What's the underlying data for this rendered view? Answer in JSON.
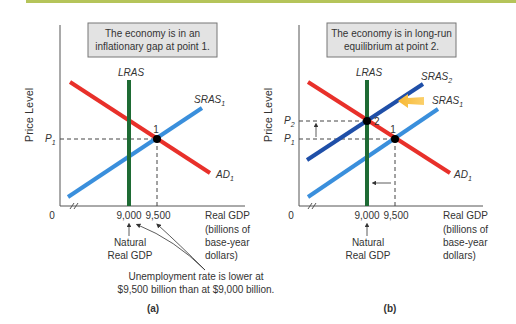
{
  "colors": {
    "top_rule": "#b5c45a",
    "ad": "#e8302a",
    "sras1": "#3a8fdc",
    "sras2": "#1f4fa8",
    "lras": "#1e6b34",
    "box_fill": "#e3e3e3",
    "box_stroke": "#777777",
    "shift_arrow": "#f5a623"
  },
  "panels": [
    {
      "id": "a",
      "caption": "(a)",
      "box_text": [
        "The economy is in an",
        "inflationary gap at point 1."
      ],
      "y_axis_label": "Price Level",
      "x_axis_label": [
        "Real GDP",
        "(billions of",
        "base-year",
        "dollars)"
      ],
      "origin": "0",
      "x_ticks": [
        "9,000",
        "9,500"
      ],
      "y_ticks": [
        {
          "main": "P",
          "sub": "1"
        }
      ],
      "curves": {
        "lras": "LRAS",
        "sras1": {
          "main": "SRAS",
          "sub": "1"
        },
        "ad1": {
          "main": "AD",
          "sub": "1"
        }
      },
      "points": [
        "1"
      ],
      "natural_label": [
        "Natural",
        "Real GDP"
      ],
      "annotation": [
        "Unemployment rate is lower at",
        "$9,500 billion than at $9,000 billion."
      ]
    },
    {
      "id": "b",
      "caption": "(b)",
      "box_text": [
        "The economy is in long-run",
        "equilibrium at point 2."
      ],
      "y_axis_label": "Price Level",
      "x_axis_label": [
        "Real GDP",
        "(billions of",
        "base-year",
        "dollars)"
      ],
      "origin": "0",
      "x_ticks": [
        "9,000",
        "9,500"
      ],
      "y_ticks": [
        {
          "main": "P",
          "sub": "2"
        },
        {
          "main": "P",
          "sub": "1"
        }
      ],
      "curves": {
        "lras": "LRAS",
        "sras2": {
          "main": "SRAS",
          "sub": "2"
        },
        "sras1": {
          "main": "SRAS",
          "sub": "1"
        },
        "ad1": {
          "main": "AD",
          "sub": "1"
        }
      },
      "points": [
        "2",
        "1"
      ],
      "natural_label": [
        "Natural",
        "Real GDP"
      ]
    }
  ]
}
